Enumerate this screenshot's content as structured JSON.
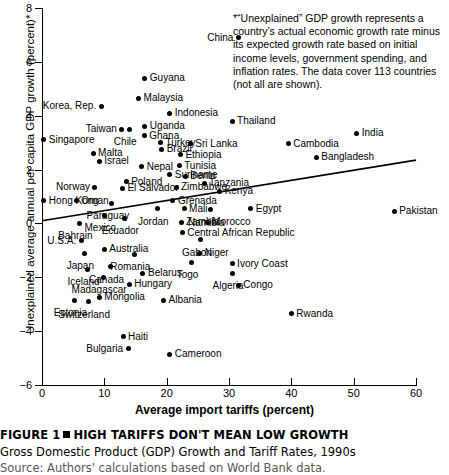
{
  "chart_data": {
    "type": "scatter",
    "title": "HIGH TARIFFS DON'T MEAN LOW GROWTH",
    "xlabel": "Average import tariffs (percent)",
    "ylabel": "Unexplained average annual per capita GDP growth (percent)*",
    "xlim": [
      0,
      60
    ],
    "ylim": [
      -6,
      8
    ],
    "xticks": [
      0,
      10,
      20,
      30,
      40,
      50,
      60
    ],
    "yticks": [
      -6,
      -4,
      -2,
      0,
      2,
      4,
      6,
      8
    ],
    "grid": false,
    "legend": null,
    "annotation": "*“Unexplained” GDP growth represents a country’s actual economic growth rate minus its expected growth rate based on initial income levels, government spending, and inflation rates. The data cover 113 countries (not all are shown).",
    "trendline": {
      "x": [
        0,
        60
      ],
      "y": [
        0.1,
        2.35
      ]
    },
    "points": [
      {
        "label": "China",
        "x": 31.5,
        "y": 6.9,
        "side": "r"
      },
      {
        "label": "Guyana",
        "x": 16.5,
        "y": 5.4,
        "side": "l"
      },
      {
        "label": "Malaysia",
        "x": 15.5,
        "y": 4.65,
        "side": "l"
      },
      {
        "label": "Korea, Rep.",
        "x": 9.5,
        "y": 4.35,
        "side": "r"
      },
      {
        "label": "Indonesia",
        "x": 20.5,
        "y": 4.1,
        "side": "l"
      },
      {
        "label": "Thailand",
        "x": 30.5,
        "y": 3.8,
        "side": "l"
      },
      {
        "label": "Uganda",
        "x": 16.5,
        "y": 3.6,
        "side": "l"
      },
      {
        "label": "Taiwan",
        "x": 12.8,
        "y": 3.5,
        "side": "r"
      },
      {
        "label": "Chile",
        "x": 14.0,
        "y": 3.5,
        "side": "b"
      },
      {
        "label": "India",
        "x": 50.5,
        "y": 3.35,
        "side": "l"
      },
      {
        "label": "Ghana",
        "x": 16.4,
        "y": 3.25,
        "side": "l"
      },
      {
        "label": "Singapore",
        "x": 0.3,
        "y": 3.1,
        "side": "l"
      },
      {
        "label": "Turkey",
        "x": 19.0,
        "y": 3.0,
        "side": "l"
      },
      {
        "label": "Sri Lanka",
        "x": 23.8,
        "y": 2.95,
        "side": "l"
      },
      {
        "label": "Cambodia",
        "x": 39.5,
        "y": 2.95,
        "side": "l"
      },
      {
        "label": "Brazil",
        "x": 19.2,
        "y": 2.75,
        "side": "l"
      },
      {
        "label": "Malta",
        "x": 8.2,
        "y": 2.6,
        "side": "l"
      },
      {
        "label": "Ethiopia",
        "x": 22.2,
        "y": 2.55,
        "side": "l"
      },
      {
        "label": "Bangladesh",
        "x": 44.0,
        "y": 2.45,
        "side": "l"
      },
      {
        "label": "Israel",
        "x": 9.2,
        "y": 2.3,
        "side": "l"
      },
      {
        "label": "Tunisia",
        "x": 22.0,
        "y": 2.15,
        "side": "l"
      },
      {
        "label": "Nepal",
        "x": 16.0,
        "y": 2.1,
        "side": "l"
      },
      {
        "label": "Suriname",
        "x": 20.5,
        "y": 1.8,
        "side": "l"
      },
      {
        "label": "Benin",
        "x": 23.0,
        "y": 1.75,
        "side": "l"
      },
      {
        "label": "Poland",
        "x": 13.5,
        "y": 1.55,
        "side": "l"
      },
      {
        "label": "Tanzania",
        "x": 26.0,
        "y": 1.5,
        "side": "l"
      },
      {
        "label": "Norway",
        "x": 8.5,
        "y": 1.35,
        "side": "r"
      },
      {
        "label": "El Salvador",
        "x": 12.9,
        "y": 1.3,
        "side": "l"
      },
      {
        "label": "Zimbabwe",
        "x": 21.5,
        "y": 1.35,
        "side": "l"
      },
      {
        "label": "Kenya",
        "x": 28.5,
        "y": 1.2,
        "side": "l"
      },
      {
        "label": "Hong Kong",
        "x": 0.3,
        "y": 0.85,
        "side": "l"
      },
      {
        "label": "Oman",
        "x": 5.5,
        "y": 0.85,
        "side": "l"
      },
      {
        "label": "Paraguay",
        "x": 11.2,
        "y": 0.75,
        "side": "b"
      },
      {
        "label": "Grenada",
        "x": 21.0,
        "y": 0.85,
        "side": "l"
      },
      {
        "label": "Jordan",
        "x": 18.5,
        "y": 0.55,
        "side": "b"
      },
      {
        "label": "Mali",
        "x": 22.8,
        "y": 0.55,
        "side": "l"
      },
      {
        "label": "Namibia",
        "x": 27.0,
        "y": 0.5,
        "side": "b"
      },
      {
        "label": "Egypt",
        "x": 33.5,
        "y": 0.55,
        "side": "l"
      },
      {
        "label": "Mexico",
        "x": 10.0,
        "y": 0.3,
        "side": "b"
      },
      {
        "label": "Ecuador",
        "x": 13.2,
        "y": 0.2,
        "side": "b"
      },
      {
        "label": "Bahrain",
        "x": 6.0,
        "y": 0.0,
        "side": "b"
      },
      {
        "label": "Zambia",
        "x": 22.3,
        "y": 0.05,
        "side": "l"
      },
      {
        "label": "Morocco",
        "x": 26.5,
        "y": 0.05,
        "side": "l"
      },
      {
        "label": "Pakistan",
        "x": 56.5,
        "y": 0.45,
        "side": "l"
      },
      {
        "label": "Central African Republic",
        "x": 22.5,
        "y": -0.35,
        "side": "l"
      },
      {
        "label": "U.S.A.",
        "x": 6.3,
        "y": -0.65,
        "side": "r"
      },
      {
        "label": "Gabon",
        "x": 25.5,
        "y": -0.6,
        "side": "b"
      },
      {
        "label": "Australia",
        "x": 10.0,
        "y": -0.95,
        "side": "l"
      },
      {
        "label": "Japan",
        "x": 6.8,
        "y": -1.1,
        "side": "b"
      },
      {
        "label": "Romania",
        "x": 14.8,
        "y": -1.15,
        "side": "b"
      },
      {
        "label": "Niger",
        "x": 25.3,
        "y": -1.1,
        "side": "l"
      },
      {
        "label": "Ivory Coast",
        "x": 30.5,
        "y": -1.5,
        "side": "l"
      },
      {
        "label": "Canada",
        "x": 11.0,
        "y": -1.6,
        "side": "b"
      },
      {
        "label": "Togo",
        "x": 24.0,
        "y": -1.45,
        "side": "b"
      },
      {
        "label": "Iceland",
        "x": 7.3,
        "y": -1.7,
        "side": "b"
      },
      {
        "label": "Belarus",
        "x": 16.2,
        "y": -1.85,
        "side": "l"
      },
      {
        "label": "Algeria",
        "x": 30.5,
        "y": -1.85,
        "side": "b"
      },
      {
        "label": "Madagascar",
        "x": 9.8,
        "y": -2.0,
        "side": "b"
      },
      {
        "label": "Hungary",
        "x": 14.0,
        "y": -2.25,
        "side": "l"
      },
      {
        "label": "Congo",
        "x": 31.5,
        "y": -2.3,
        "side": "l"
      },
      {
        "label": "Estonia",
        "x": 5.2,
        "y": -2.85,
        "side": "b"
      },
      {
        "label": "Mongolia",
        "x": 9.2,
        "y": -2.75,
        "side": "l"
      },
      {
        "label": "Albania",
        "x": 19.5,
        "y": -2.85,
        "side": "l"
      },
      {
        "label": "Switzerland",
        "x": 7.4,
        "y": -2.9,
        "side": "b"
      },
      {
        "label": "Rwanda",
        "x": 40.0,
        "y": -3.35,
        "side": "l"
      },
      {
        "label": "Haiti",
        "x": 13.0,
        "y": -4.2,
        "side": "l"
      },
      {
        "label": "Bulgaria",
        "x": 13.8,
        "y": -4.65,
        "side": "r"
      },
      {
        "label": "Cameroon",
        "x": 20.5,
        "y": -4.85,
        "side": "l"
      }
    ]
  },
  "caption": {
    "figure_label": "FIGURE 1",
    "title": "HIGH TARIFFS DON'T MEAN LOW GROWTH",
    "subtitle": "Gross Domestic Product (GDP) Growth and Tariff Rates, 1990s",
    "source": "Source: Authors' calculations based on World Bank data."
  }
}
